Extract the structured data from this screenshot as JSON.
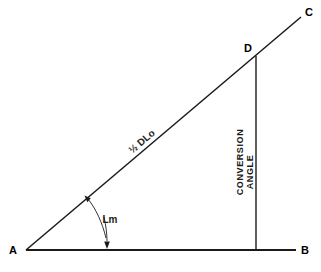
{
  "diagram": {
    "background_color": "#ffffff",
    "line_color": "#1a1a1a",
    "vertices": {
      "a": "A",
      "b": "B",
      "c": "C",
      "d": "D"
    },
    "labels": {
      "hypotenuse": "½ DLo",
      "angle": "Lm",
      "conversion_line1": "CONVERSION",
      "conversion_line2": "ANGLE"
    },
    "geometry": {
      "point_a": {
        "x": 26,
        "y": 250
      },
      "point_b": {
        "x": 296,
        "y": 250
      },
      "point_c": {
        "x": 301,
        "y": 17
      },
      "point_d": {
        "x": 256,
        "y": 56
      },
      "vertical_foot": {
        "x": 256,
        "y": 250
      },
      "baseline_length": 270,
      "diagonal_angle_deg": 40.8
    }
  }
}
